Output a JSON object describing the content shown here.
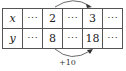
{
  "table": {
    "rows": [
      {
        "header": "x",
        "cells": [
          "⋯",
          "2",
          "⋯",
          "3",
          "⋯"
        ]
      },
      {
        "header": "y",
        "cells": [
          "⋯",
          "8",
          "⋯",
          "18",
          "⋯"
        ]
      }
    ]
  },
  "arrows": {
    "top": {
      "from": "2",
      "to": "3",
      "label": ""
    },
    "bottom": {
      "from": "8",
      "to": "18",
      "label": "+10"
    }
  }
}
